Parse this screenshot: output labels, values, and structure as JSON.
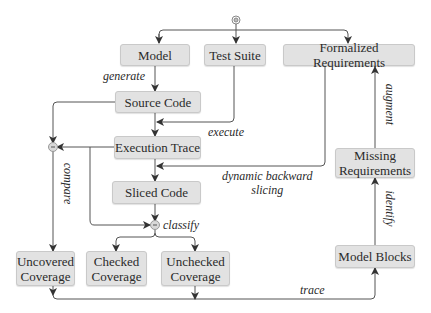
{
  "diagram": {
    "nodes": {
      "model": "Model",
      "test_suite": "Test Suite",
      "formalized_requirements": "Formalized Requirements",
      "source_code": "Source Code",
      "execution_trace": "Execution Trace",
      "sliced_code": "Sliced Code",
      "missing_requirements": "Missing\nRequirements",
      "uncovered_coverage": "Uncovered\nCoverage",
      "checked_coverage": "Checked\nCoverage",
      "unchecked_coverage": "Unchecked\nCoverage",
      "model_blocks": "Model Blocks"
    },
    "edge_labels": {
      "generate": "generate",
      "execute": "execute",
      "compare": "compare",
      "dynamic_backward_slicing": "dynamic backward\nslicing",
      "classify": "classify",
      "augment": "augment",
      "identify": "identify",
      "trace": "trace"
    },
    "merge_symbol": "-",
    "colors": {
      "box_fill": "#e2e2e2",
      "box_border": "#c9c9c9",
      "line": "#444444"
    }
  }
}
